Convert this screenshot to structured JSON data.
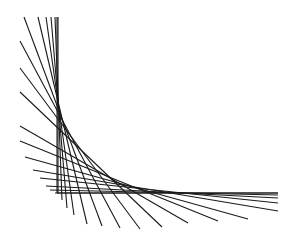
{
  "diagram": {
    "type": "line-envelope",
    "stroke_color": "#1a1a1a",
    "background": "#ffffff",
    "axes": {
      "vertical": {
        "x1": 57,
        "y1": 17,
        "x2": 57,
        "y2": 193
      },
      "horizontal": {
        "x1": 57,
        "y1": 193,
        "x2": 278,
        "y2": 193
      }
    },
    "lines": [
      {
        "x1": 58,
        "y1": 17,
        "x2": 58,
        "y2": 193
      },
      {
        "x1": 55,
        "y1": 17,
        "x2": 62,
        "y2": 200
      },
      {
        "x1": 51,
        "y1": 17,
        "x2": 67,
        "y2": 208
      },
      {
        "x1": 46,
        "y1": 17,
        "x2": 74,
        "y2": 215
      },
      {
        "x1": 38,
        "y1": 17,
        "x2": 87,
        "y2": 224
      },
      {
        "x1": 24,
        "y1": 17,
        "x2": 102,
        "y2": 226
      },
      {
        "x1": 20,
        "y1": 41,
        "x2": 120,
        "y2": 228
      },
      {
        "x1": 20,
        "y1": 68,
        "x2": 140,
        "y2": 229
      },
      {
        "x1": 20,
        "y1": 92,
        "x2": 162,
        "y2": 227
      },
      {
        "x1": 20,
        "y1": 126,
        "x2": 188,
        "y2": 223
      },
      {
        "x1": 20,
        "y1": 141,
        "x2": 218,
        "y2": 221
      },
      {
        "x1": 25,
        "y1": 157,
        "x2": 248,
        "y2": 219
      },
      {
        "x1": 33,
        "y1": 170,
        "x2": 278,
        "y2": 211
      },
      {
        "x1": 40,
        "y1": 178,
        "x2": 278,
        "y2": 203
      },
      {
        "x1": 46,
        "y1": 186,
        "x2": 278,
        "y2": 198
      },
      {
        "x1": 50,
        "y1": 190,
        "x2": 278,
        "y2": 195
      },
      {
        "x1": 55,
        "y1": 193,
        "x2": 278,
        "y2": 193
      }
    ]
  }
}
